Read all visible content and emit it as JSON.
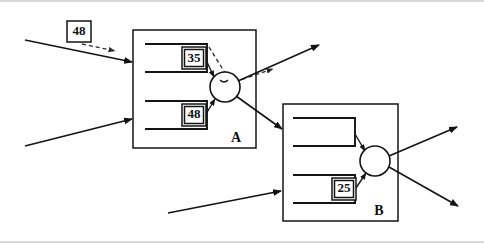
{
  "diagram": {
    "title": "",
    "type": "block-flow-diagram",
    "colors": {
      "stroke": "#141414",
      "background": "#ffffff",
      "band": "#d8d8d8"
    },
    "frames": [
      {
        "id": "A",
        "label": "A",
        "x": 133,
        "y": 30,
        "width": 123,
        "height": 118,
        "label_x": 236,
        "label_y": 139
      },
      {
        "id": "B",
        "label": "B",
        "x": 283,
        "y": 104,
        "width": 115,
        "height": 117,
        "label_x": 379,
        "label_y": 212
      }
    ],
    "value_boxes": [
      {
        "id": "ext-48",
        "label": "48",
        "x": 67,
        "y": 21,
        "width": 24,
        "height": 21
      },
      {
        "id": "a-upper-35",
        "label": "35",
        "x": 182,
        "y": 47,
        "width": 24,
        "height": 22
      },
      {
        "id": "a-lower-48",
        "label": "48",
        "x": 182,
        "y": 104,
        "width": 24,
        "height": 22
      },
      {
        "id": "b-lower-25",
        "label": "25",
        "x": 332,
        "y": 178,
        "width": 24,
        "height": 22
      }
    ],
    "nodes": [
      {
        "id": "node-a",
        "shape": "circle",
        "cx": 225,
        "cy": 87,
        "r": 15
      },
      {
        "id": "node-b",
        "shape": "circle",
        "cx": 375,
        "cy": 161,
        "r": 15
      }
    ],
    "slots": [
      {
        "id": "slot-a-upper",
        "frame": "A",
        "x1": 145,
        "y1": 44,
        "x2": 207,
        "y2": 72
      },
      {
        "id": "slot-a-lower",
        "frame": "A",
        "x1": 145,
        "y1": 101,
        "x2": 207,
        "y2": 129
      },
      {
        "id": "slot-b-upper",
        "frame": "B",
        "x1": 293,
        "y1": 118,
        "x2": 355,
        "y2": 146
      },
      {
        "id": "slot-b-lower",
        "frame": "B",
        "x1": 293,
        "y1": 175,
        "x2": 355,
        "y2": 203
      }
    ],
    "arrows": [
      {
        "id": "input-a-upper",
        "style": "solid",
        "from_x": 25,
        "from_y": 40,
        "to_x": 132,
        "to_y": 62
      },
      {
        "id": "input-a-lower",
        "style": "solid",
        "from_x": 25,
        "from_y": 146,
        "to_x": 132,
        "to_y": 119
      },
      {
        "id": "external-48-dashed",
        "style": "dashed",
        "from_x": 82,
        "from_y": 44,
        "to_x": 117,
        "to_y": 51
      },
      {
        "id": "a-slot-upper-to-node",
        "style": "solid",
        "from_x": 208,
        "from_y": 62,
        "to_x": 213,
        "to_y": 77
      },
      {
        "id": "a-slot-lower-to-node",
        "style": "solid",
        "from_x": 208,
        "from_y": 112,
        "to_x": 214,
        "to_y": 98
      },
      {
        "id": "a-dashed-through-node",
        "style": "dashed",
        "from_x": 210,
        "from_y": 48,
        "to_x": 275,
        "to_y": 70
      },
      {
        "id": "a-node-out-up",
        "style": "solid",
        "from_x": 238,
        "from_y": 82,
        "to_x": 320,
        "to_y": 45
      },
      {
        "id": "a-node-out-down",
        "style": "solid",
        "from_x": 236,
        "from_y": 96,
        "to_x": 283,
        "to_y": 129
      },
      {
        "id": "input-b-lower",
        "style": "solid",
        "from_x": 168,
        "from_y": 213,
        "to_x": 282,
        "to_y": 191
      },
      {
        "id": "b-slot-upper-to-node",
        "style": "solid",
        "from_x": 356,
        "from_y": 136,
        "to_x": 366,
        "to_y": 150
      },
      {
        "id": "b-slot-lower-to-node",
        "style": "solid",
        "from_x": 357,
        "from_y": 186,
        "to_x": 367,
        "to_y": 172
      },
      {
        "id": "b-node-out-up",
        "style": "solid",
        "from_x": 389,
        "from_y": 156,
        "to_x": 458,
        "to_y": 127
      },
      {
        "id": "b-node-out-down",
        "style": "solid",
        "from_x": 389,
        "from_y": 167,
        "to_x": 459,
        "to_y": 206
      }
    ]
  }
}
